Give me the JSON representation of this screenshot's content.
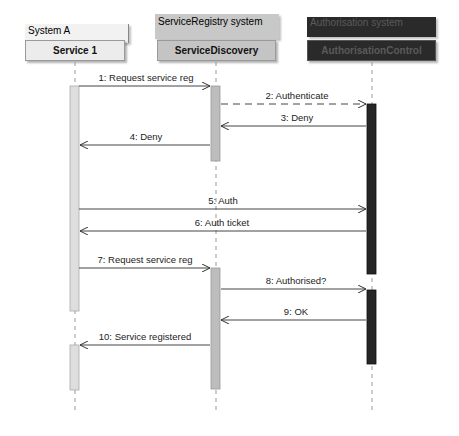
{
  "diagram": {
    "type": "sequence",
    "participants": [
      {
        "system": "System A",
        "component": "Service 1",
        "system_fill": "#f2f2f2",
        "component_fill": "#ececec",
        "text_color": "#111111"
      },
      {
        "system": "ServiceRegistry system",
        "component": "ServiceDiscovery",
        "system_fill": "#c8c8c8",
        "component_fill": "#c4c4c4",
        "text_color": "#111111"
      },
      {
        "system": "Authorisation system",
        "component": "AuthorisationControl",
        "system_fill": "#2a2a2a",
        "component_fill": "#2a2a2a",
        "text_color": "#5a5a5a"
      }
    ],
    "messages": [
      {
        "label": "1: Request service reg",
        "from": "Service 1",
        "to": "ServiceDiscovery",
        "style": "solid"
      },
      {
        "label": "2: Authenticate",
        "from": "ServiceDiscovery",
        "to": "AuthorisationControl",
        "style": "dashed"
      },
      {
        "label": "3: Deny",
        "from": "AuthorisationControl",
        "to": "ServiceDiscovery",
        "style": "solid"
      },
      {
        "label": "4: Deny",
        "from": "ServiceDiscovery",
        "to": "Service 1",
        "style": "solid"
      },
      {
        "label": "5: Auth",
        "from": "Service 1",
        "to": "AuthorisationControl",
        "style": "solid"
      },
      {
        "label": "6: Auth ticket",
        "from": "AuthorisationControl",
        "to": "Service 1",
        "style": "solid"
      },
      {
        "label": "7: Request service reg",
        "from": "Service 1",
        "to": "ServiceDiscovery",
        "style": "solid"
      },
      {
        "label": "8: Authorised?",
        "from": "ServiceDiscovery",
        "to": "AuthorisationControl",
        "style": "solid"
      },
      {
        "label": "9: OK",
        "from": "AuthorisationControl",
        "to": "ServiceDiscovery",
        "style": "solid"
      },
      {
        "label": "10: Service registered",
        "from": "ServiceDiscovery",
        "to": "Service 1",
        "style": "solid"
      }
    ]
  }
}
